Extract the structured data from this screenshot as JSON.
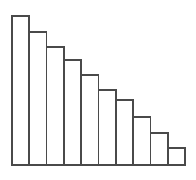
{
  "figure": {
    "name": "decreasing-bar-chart",
    "width": 196,
    "height": 180,
    "background_color": "#ffffff",
    "stroke_color": "#4a4a4a",
    "bar_fill_color": "#ffffff",
    "stroke_width": 1.6
  },
  "plot_area": {
    "left": 12,
    "right": 185,
    "baseline_y": 165,
    "top": 12,
    "bar_width": 17.3,
    "bar_gap": 0
  },
  "chart_data": {
    "type": "bar",
    "title": "",
    "subtitle": "",
    "xlabel": "",
    "ylabel": "",
    "categories": [
      "1",
      "2",
      "3",
      "4",
      "5",
      "6",
      "7",
      "8",
      "9",
      "10"
    ],
    "values": [
      149,
      133,
      118,
      105,
      90,
      75,
      65,
      48,
      32,
      17
    ],
    "bar_tops_px": [
      16,
      32,
      47,
      60,
      75,
      90,
      100,
      117,
      133,
      148
    ],
    "ylim": [
      0,
      153
    ],
    "xlim": [
      0,
      10
    ],
    "grid": false,
    "legend": false,
    "legend_position": "none",
    "tick_labels_x": [],
    "tick_labels_y": [],
    "annotations": [],
    "n_bars": 10,
    "orientation": "vertical",
    "series": [
      {
        "name": "series-1",
        "values": [
          149,
          133,
          118,
          105,
          90,
          75,
          65,
          48,
          32,
          17
        ]
      }
    ]
  }
}
